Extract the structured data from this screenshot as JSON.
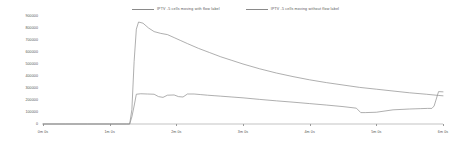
{
  "chart_data": {
    "type": "line",
    "title": "",
    "xlabel": "",
    "ylabel": "",
    "grid": false,
    "legend_position": "top-center",
    "xlim": [
      0,
      360
    ],
    "ylim": [
      0,
      900000
    ],
    "x_tick_labels": [
      "0m 0s",
      "1m 0s",
      "2m 0s",
      "3m 0s",
      "4m 0s",
      "5m 0s",
      "6m 0s"
    ],
    "x_tick_values": [
      0,
      60,
      120,
      180,
      240,
      300,
      360
    ],
    "y_tick_labels": [
      "900000",
      "800000",
      "700000",
      "600000",
      "500000",
      "400000",
      "300000",
      "200000",
      "100000",
      "0"
    ],
    "y_tick_values": [
      900000,
      800000,
      700000,
      600000,
      500000,
      400000,
      300000,
      200000,
      100000,
      0
    ],
    "series": [
      {
        "name": "IPTV -5 cells moving with flow label",
        "color": "#8c8c8c",
        "x": [
          0,
          20,
          40,
          60,
          75,
          78,
          80,
          82,
          84,
          86,
          90,
          95,
          100,
          106,
          112,
          118,
          124,
          130,
          140,
          150,
          160,
          170,
          180,
          195,
          210,
          225,
          240,
          255,
          270,
          285,
          300,
          315,
          330,
          345,
          356,
          360
        ],
        "values": [
          0,
          0,
          0,
          0,
          0,
          0,
          120000,
          520000,
          790000,
          850000,
          840000,
          800000,
          770000,
          755000,
          745000,
          720000,
          695000,
          670000,
          630000,
          595000,
          560000,
          530000,
          500000,
          460000,
          425000,
          395000,
          368000,
          345000,
          325000,
          305000,
          290000,
          275000,
          260000,
          248000,
          238000,
          235000
        ]
      },
      {
        "name": "IPTV -5 cells moving without flow label",
        "color": "#8c8c8c",
        "x": [
          0,
          20,
          40,
          60,
          75,
          78,
          80,
          82,
          84,
          88,
          94,
          100,
          104,
          108,
          112,
          118,
          122,
          126,
          130,
          136,
          142,
          148,
          154,
          160,
          170,
          180,
          195,
          210,
          225,
          240,
          255,
          270,
          282,
          286,
          290,
          300,
          315,
          330,
          340,
          346,
          350,
          352,
          356,
          360
        ],
        "values": [
          0,
          0,
          0,
          0,
          0,
          0,
          60000,
          150000,
          248000,
          252000,
          250000,
          248000,
          228000,
          222000,
          240000,
          242000,
          228000,
          225000,
          250000,
          250000,
          245000,
          240000,
          236000,
          232000,
          225000,
          218000,
          205000,
          193000,
          182000,
          170000,
          158000,
          145000,
          132000,
          95000,
          95000,
          98000,
          118000,
          125000,
          128000,
          130000,
          130000,
          150000,
          270000,
          268000
        ]
      }
    ]
  },
  "legend": {
    "entries": [
      {
        "label": "IPTV -5 cells moving with flow label",
        "icon": "line-swatch-icon"
      },
      {
        "label": "IPTV -5 cells moving without flow label",
        "icon": "line-swatch-icon"
      }
    ]
  }
}
